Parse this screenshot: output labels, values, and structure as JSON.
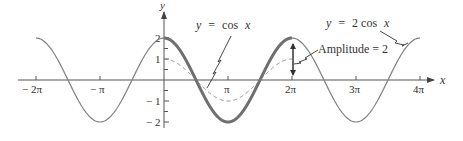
{
  "chart_data": {
    "type": "line",
    "title": "",
    "xlabel": "x",
    "ylabel": "y",
    "xlim": [
      -6.2832,
      12.5664
    ],
    "ylim": [
      -2,
      2
    ],
    "grid": false,
    "x_ticks": [
      {
        "value": -6.2832,
        "label": "− 2π"
      },
      {
        "value": -3.1416,
        "label": "− π"
      },
      {
        "value": 3.1416,
        "label": "π"
      },
      {
        "value": 6.2832,
        "label": "2π"
      },
      {
        "value": 9.4248,
        "label": "3π"
      },
      {
        "value": 12.5664,
        "label": "4π"
      }
    ],
    "y_ticks": [
      {
        "value": 2,
        "label": "2"
      },
      {
        "value": 1,
        "label": "1"
      },
      {
        "value": -1,
        "label": "− 1"
      },
      {
        "value": -2,
        "label": "− 2"
      }
    ],
    "series": [
      {
        "name": "y = 2 cos x",
        "function": "2*cos(x)",
        "domain": [
          -6.2832,
          12.5664
        ],
        "highlight_domain": [
          0,
          6.2832
        ],
        "style": "solid",
        "x": [
          -6.2832,
          -4.7124,
          -3.1416,
          -1.5708,
          0,
          1.5708,
          3.1416,
          4.7124,
          6.2832,
          7.854,
          9.4248,
          10.9956,
          12.5664
        ],
        "values": [
          2,
          0,
          -2,
          0,
          2,
          0,
          -2,
          0,
          2,
          0,
          -2,
          0,
          2
        ]
      },
      {
        "name": "y = cos x",
        "function": "cos(x)",
        "domain": [
          0,
          6.2832
        ],
        "style": "dashed",
        "x": [
          0,
          1.5708,
          3.1416,
          4.7124,
          6.2832
        ],
        "values": [
          1,
          0,
          -1,
          0,
          1
        ]
      }
    ],
    "annotations": [
      {
        "text": "y = cos x",
        "points_to": "dashed curve near x ≈ 0.5π"
      },
      {
        "text": "y = 2 cos x",
        "points_to": "solid curve near x ≈ 3.8π"
      },
      {
        "text": "Amplitude = 2",
        "points_to": "double arrow at x = 2π from y = 0 to y = 2"
      }
    ]
  },
  "labels": {
    "y_axis": "y",
    "x_axis": "x",
    "cos_label_y": "y",
    "cos_label_eq": "=",
    "cos_label_fn": "cos",
    "cos_label_x": "x",
    "twocos_label_y": "y",
    "twocos_label_eq": "=",
    "twocos_label_fn": "2  cos",
    "twocos_label_x": "x",
    "amplitude_label": "Amplitude  =  2",
    "tick_m2pi": "− 2π",
    "tick_mpi": "− π",
    "tick_pi": "π",
    "tick_2pi": "2π",
    "tick_3pi": "3π",
    "tick_4pi": "4π",
    "tick_y2": "2",
    "tick_y1": "1",
    "tick_ym1": "− 1",
    "tick_ym2": "− 2"
  },
  "colors": {
    "curve": "#808080",
    "curve_bold": "#6f6f6f",
    "axis": "#555555",
    "text": "#333333"
  }
}
